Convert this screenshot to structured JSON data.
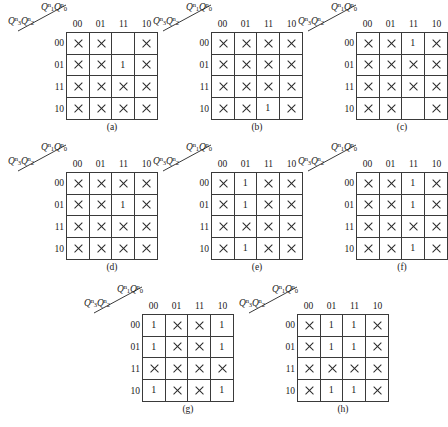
{
  "figure": {
    "type": "karnaugh-map-set",
    "map_count": 8,
    "row_var_label": "Q3nQ2n",
    "col_var_label": "Q1nQ0n",
    "col_headers": [
      "00",
      "01",
      "11",
      "10"
    ],
    "row_headers": [
      "00",
      "01",
      "11",
      "10"
    ],
    "var_parts": {
      "col": [
        {
          "base": "Q",
          "sub": "1",
          "sup": "n"
        },
        {
          "base": "Q",
          "sub": "0",
          "sup": "n"
        }
      ],
      "row": [
        {
          "base": "Q",
          "sub": "3",
          "sup": "n"
        },
        {
          "base": "Q",
          "sub": "2",
          "sup": "n"
        }
      ]
    },
    "symbols": {
      "dontcare": "×",
      "one": "1",
      "blank": ""
    },
    "colors": {
      "grid_line": "#3a3a3a",
      "text": "#1a1a1a",
      "background": "#ffffff"
    }
  },
  "maps": [
    {
      "caption": "(a)",
      "cells": [
        [
          "x",
          "x",
          "",
          "x"
        ],
        [
          "x",
          "x",
          "1",
          "x"
        ],
        [
          "x",
          "x",
          "x",
          "x"
        ],
        [
          "x",
          "x",
          "x",
          "x"
        ]
      ]
    },
    {
      "caption": "(b)",
      "cells": [
        [
          "x",
          "x",
          "x",
          "x"
        ],
        [
          "x",
          "x",
          "x",
          "x"
        ],
        [
          "x",
          "x",
          "x",
          "x"
        ],
        [
          "x",
          "x",
          "1",
          "x"
        ]
      ]
    },
    {
      "caption": "(c)",
      "cells": [
        [
          "x",
          "x",
          "1",
          "x"
        ],
        [
          "x",
          "x",
          "x",
          "x"
        ],
        [
          "x",
          "x",
          "x",
          "x"
        ],
        [
          "x",
          "x",
          "",
          "x"
        ]
      ]
    },
    {
      "caption": "(d)",
      "cells": [
        [
          "x",
          "x",
          "x",
          "x"
        ],
        [
          "x",
          "x",
          "1",
          "x"
        ],
        [
          "x",
          "x",
          "x",
          "x"
        ],
        [
          "x",
          "x",
          "x",
          "x"
        ]
      ]
    },
    {
      "caption": "(e)",
      "cells": [
        [
          "x",
          "1",
          "x",
          "x"
        ],
        [
          "x",
          "1",
          "x",
          "x"
        ],
        [
          "x",
          "x",
          "x",
          "x"
        ],
        [
          "x",
          "1",
          "x",
          "x"
        ]
      ]
    },
    {
      "caption": "(f)",
      "cells": [
        [
          "x",
          "x",
          "1",
          "x"
        ],
        [
          "x",
          "x",
          "1",
          "x"
        ],
        [
          "x",
          "x",
          "x",
          "x"
        ],
        [
          "x",
          "x",
          "1",
          "x"
        ]
      ]
    },
    {
      "caption": "(g)",
      "cells": [
        [
          "1",
          "x",
          "x",
          "1"
        ],
        [
          "1",
          "x",
          "x",
          "1"
        ],
        [
          "x",
          "x",
          "x",
          "x"
        ],
        [
          "1",
          "x",
          "x",
          "1"
        ]
      ]
    },
    {
      "caption": "(h)",
      "cells": [
        [
          "x",
          "1",
          "1",
          "x"
        ],
        [
          "x",
          "1",
          "1",
          "x"
        ],
        [
          "x",
          "x",
          "x",
          "x"
        ],
        [
          "x",
          "1",
          "1",
          "x"
        ]
      ]
    }
  ],
  "layout": {
    "positions": [
      {
        "left": 0,
        "top": 0
      },
      {
        "left": 145,
        "top": 0
      },
      {
        "left": 290,
        "top": 0
      },
      {
        "left": 0,
        "top": 140
      },
      {
        "left": 145,
        "top": 140
      },
      {
        "left": 290,
        "top": 140
      },
      {
        "left": 76,
        "top": 282
      },
      {
        "left": 231,
        "top": 282
      }
    ]
  }
}
